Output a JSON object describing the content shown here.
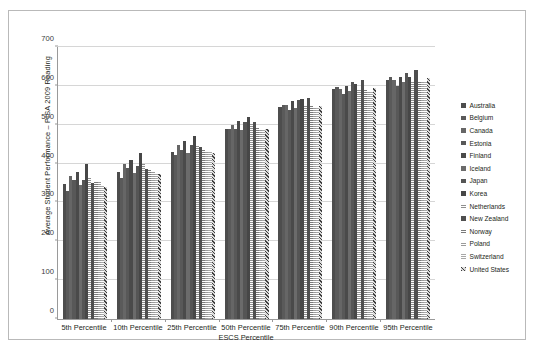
{
  "chart_data": {
    "type": "bar",
    "title": "",
    "xlabel": "ESCS Percentile",
    "ylabel": "Average Student Performance – PISA 2009 Reading",
    "ylim": [
      0,
      700
    ],
    "yticks": [
      0,
      100,
      200,
      300,
      400,
      500,
      600,
      700
    ],
    "grid": true,
    "legend_position": "right",
    "categories": [
      "5th Percentile",
      "10th Percentile",
      "25th Percentile",
      "50th Percentile",
      "75th Percentile",
      "90th Percentile",
      "95th Percentile"
    ],
    "series": [
      {
        "name": "Australia",
        "color": "#4d4d4d",
        "pattern": "solid",
        "values": [
          347,
          379,
          431,
          489,
          546,
          591,
          616
        ]
      },
      {
        "name": "Belgium",
        "color": "#5a5a5a",
        "pattern": "solid",
        "values": [
          330,
          362,
          421,
          489,
          552,
          598,
          623
        ]
      },
      {
        "name": "Canada",
        "color": "#666666",
        "pattern": "solid",
        "values": [
          369,
          399,
          447,
          500,
          551,
          593,
          616
        ]
      },
      {
        "name": "Estonia",
        "color": "#585858",
        "pattern": "solid",
        "values": [
          359,
          389,
          436,
          488,
          538,
          578,
          600
        ]
      },
      {
        "name": "Finland",
        "color": "#4a4a4a",
        "pattern": "solid",
        "values": [
          379,
          410,
          458,
          510,
          560,
          600,
          622
        ]
      },
      {
        "name": "Iceland",
        "color": "#6b6b6b",
        "pattern": "solid",
        "values": [
          344,
          376,
          428,
          486,
          543,
          586,
          610
        ]
      },
      {
        "name": "Japan",
        "color": "#555555",
        "pattern": "solid",
        "values": [
          359,
          393,
          448,
          508,
          564,
          609,
          634
        ]
      },
      {
        "name": "Korea",
        "color": "#474747",
        "pattern": "solid",
        "values": [
          399,
          427,
          470,
          519,
          566,
          604,
          624
        ]
      },
      {
        "name": "Netherlands",
        "color": "#8f8f8f",
        "pattern": "hatch",
        "values": [
          366,
          398,
          449,
          503,
          552,
          591,
          613
        ]
      },
      {
        "name": "New Zealand",
        "color": "#4f4f4f",
        "pattern": "solid",
        "values": [
          351,
          386,
          443,
          508,
          568,
          615,
          641
        ]
      },
      {
        "name": "Norway",
        "color": "#7a7a7a",
        "pattern": "hatch",
        "values": [
          354,
          385,
          435,
          492,
          547,
          590,
          613
        ]
      },
      {
        "name": "Poland",
        "color": "#9b9b9b",
        "pattern": "hatch",
        "values": [
          352,
          382,
          432,
          489,
          545,
          588,
          612
        ]
      },
      {
        "name": "Switzerland",
        "color": "#a8a8a8",
        "pattern": "hatch",
        "values": [
          345,
          377,
          430,
          487,
          543,
          586,
          610
        ]
      },
      {
        "name": "United States",
        "color": "#3f3f3f",
        "pattern": "crosshatch",
        "values": [
          340,
          372,
          427,
          488,
          548,
          594,
          620
        ]
      }
    ]
  },
  "legend": {
    "items": [
      {
        "label": "Australia"
      },
      {
        "label": "Belgium"
      },
      {
        "label": "Canada"
      },
      {
        "label": "Estonia"
      },
      {
        "label": "Finland"
      },
      {
        "label": "Iceland"
      },
      {
        "label": "Japan"
      },
      {
        "label": "Korea"
      },
      {
        "label": "Netherlands"
      },
      {
        "label": "New Zealand"
      },
      {
        "label": "Norway"
      },
      {
        "label": "Poland"
      },
      {
        "label": "Switzerland"
      },
      {
        "label": "United States"
      }
    ]
  },
  "caption": {
    "text": ""
  }
}
